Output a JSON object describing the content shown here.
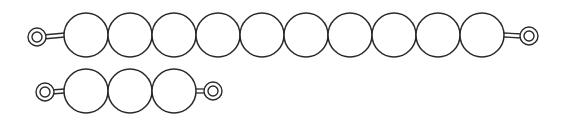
{
  "diagram": {
    "stroke_color": "#2a2a2a",
    "fill_color": "#ffffff",
    "bead_radius": 22,
    "strings": [
      {
        "name": "ten-bead-string",
        "bead_count": 10,
        "first_bead_cx": 86,
        "cy": 35,
        "spacing": 44,
        "left_eye": {
          "cx": 37,
          "cy": 37
        },
        "right_eye": {
          "cx": 529,
          "cy": 36
        }
      },
      {
        "name": "three-bead-string",
        "bead_count": 3,
        "first_bead_cx": 86,
        "cy": 91,
        "spacing": 44,
        "left_eye": {
          "cx": 45,
          "cy": 92
        },
        "right_eye": {
          "cx": 213,
          "cy": 91
        }
      }
    ]
  }
}
